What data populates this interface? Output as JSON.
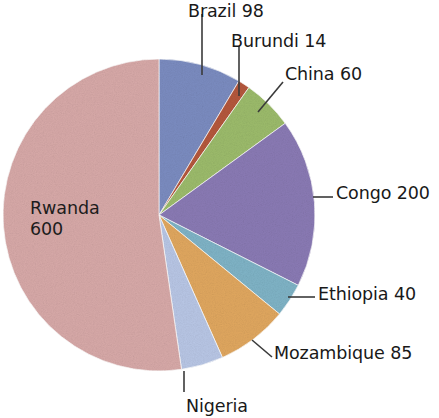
{
  "chart_data": {
    "type": "pie",
    "title": "",
    "subtitle": "",
    "xlabel": "",
    "ylabel": "",
    "legend_position": "callout-labels",
    "grid": false,
    "categories": [
      "Brazil",
      "Burundi",
      "China",
      "Congo",
      "Ethiopia",
      "Mozambique",
      "Nigeria",
      "Rwanda"
    ],
    "values": [
      98,
      14,
      60,
      200,
      40,
      85,
      50,
      600
    ],
    "total": 1147,
    "label_texts": [
      "Brazil 98",
      "Burundi 14",
      "China 60",
      "Congo 200",
      "Ethiopia 40",
      "Mozambique 85",
      "Nigeria",
      "Rwanda"
    ],
    "slices": [
      {
        "name": "Brazil",
        "value": 98,
        "label": "Brazil 98",
        "color": "#7b8cc0",
        "start_angle": 0,
        "end_angle": 30.8
      },
      {
        "name": "Burundi",
        "value": 14,
        "label": "Burundi 14",
        "color": "#b4573c",
        "start_angle": 30.8,
        "end_angle": 35.2
      },
      {
        "name": "China",
        "value": 60,
        "label": "China 60",
        "color": "#9cbb6b",
        "start_angle": 35.2,
        "end_angle": 54.0
      },
      {
        "name": "Congo",
        "value": 200,
        "label": "Congo 200",
        "color": "#8a7ab4",
        "start_angle": 54.0,
        "end_angle": 116.8
      },
      {
        "name": "Ethiopia",
        "value": 40,
        "label": "Ethiopia 40",
        "color": "#7fb3c6",
        "start_angle": 116.8,
        "end_angle": 129.4
      },
      {
        "name": "Mozambique",
        "value": 85,
        "label": "Mozambique 85",
        "color": "#e0a75f",
        "start_angle": 129.4,
        "end_angle": 156.0
      },
      {
        "name": "Nigeria",
        "value": 50,
        "label": "Nigeria",
        "color": "#b8c6e5",
        "start_angle": 156.0,
        "end_angle": 171.7
      },
      {
        "name": "Rwanda",
        "value": 600,
        "label": "Rwanda",
        "color": "#d7a9a8",
        "start_angle": 171.7,
        "end_angle": 360
      }
    ]
  },
  "labels": {
    "brazil": "Brazil 98",
    "burundi": "Burundi 14",
    "china": "China 60",
    "congo": "Congo 200",
    "ethiopia": "Ethiopia 40",
    "mozambique": "Mozambique 85",
    "nigeria": "Nigeria",
    "rwanda_name": "Rwanda",
    "rwanda_value": "600"
  },
  "colors": {
    "brazil": "#7b8cc0",
    "burundi": "#b4573c",
    "china": "#9cbb6b",
    "congo": "#8a7ab4",
    "ethiopia": "#7fb3c6",
    "mozambique": "#e0a75f",
    "nigeria": "#b8c6e5",
    "rwanda": "#d7a9a8",
    "leader_line": "#3a3a3a",
    "text": "#191919",
    "background": "#ffffff"
  },
  "geometry": {
    "center_x": 159,
    "center_y": 215,
    "radius": 156
  }
}
